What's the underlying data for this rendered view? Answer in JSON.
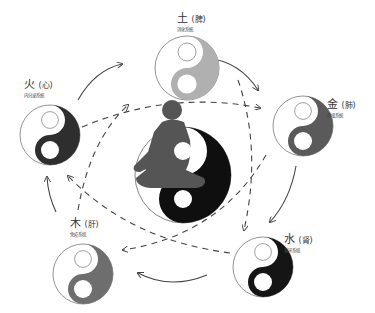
{
  "diagram": {
    "nodes": [
      {
        "id": "earth",
        "element": "土",
        "organ": "(脾)",
        "system": "消化系統",
        "yin_color": "#b0b0b0",
        "cx": 187,
        "cy": 68,
        "r": 32,
        "label_x": 177,
        "label_y": 13
      },
      {
        "id": "metal",
        "element": "金",
        "organ": "(肺)",
        "system": "呼吸系統",
        "yin_color": "#5a5a5a",
        "cx": 303,
        "cy": 126,
        "r": 30,
        "label_x": 327,
        "label_y": 99
      },
      {
        "id": "water",
        "element": "水",
        "organ": "(肾)",
        "system": "循环系统",
        "yin_color": "#151515",
        "cx": 263,
        "cy": 267,
        "r": 30,
        "label_x": 284,
        "label_y": 234
      },
      {
        "id": "wood",
        "element": "木",
        "organ": "(肝)",
        "system": "免疫系统",
        "yin_color": "#6e6e6e",
        "cx": 83,
        "cy": 274,
        "r": 30,
        "label_x": 70,
        "label_y": 218
      },
      {
        "id": "fire",
        "element": "火",
        "organ": "(心)",
        "system": "内分泌系統",
        "yin_color": "#2e2e2e",
        "cx": 50,
        "cy": 135,
        "r": 30,
        "label_x": 24,
        "label_y": 79
      }
    ],
    "center": {
      "id": "center-figure",
      "cx": 183,
      "cy": 175,
      "r": 48,
      "yin_color": "#0f0f0f",
      "figure_color": "#555555"
    },
    "generating_cycle": "solid arrows clockwise around the outer circle",
    "controlling_cycle": "dashed arrows forming a star through the center"
  }
}
